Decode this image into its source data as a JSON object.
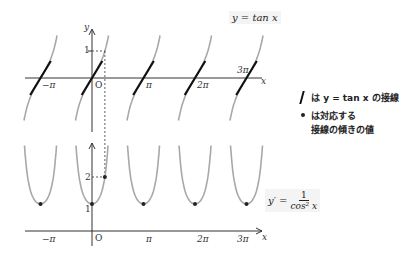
{
  "chart_data": [
    {
      "type": "line",
      "title": "y = tan x",
      "function": "tan x",
      "xlabel": "x",
      "ylabel": "y",
      "x_ticks": [
        "−π",
        "O",
        "π",
        "2π",
        "3π"
      ],
      "x_tick_values_over_pi": [
        -1,
        0,
        1,
        2,
        3
      ],
      "y_ticks": [
        "1"
      ],
      "y_tick_values": [
        1
      ],
      "branches_centered_at_over_pi": [
        -1,
        0,
        1,
        2,
        3
      ],
      "tangent_points_over_pi": [
        -1,
        0,
        1,
        2,
        3
      ],
      "tangent_slope": 1,
      "dashed_guide": {
        "x_over_pi": 0.25,
        "y": 1
      },
      "ylim": [
        -1.6,
        1.6
      ],
      "xlim_over_pi": [
        -1.5,
        3.3
      ]
    },
    {
      "type": "line",
      "title": "y' = 1 / cos² x",
      "function": "1/cos^2 x",
      "xlabel": "x",
      "ylabel": "",
      "x_ticks": [
        "−π",
        "O",
        "π",
        "2π",
        "3π"
      ],
      "x_tick_values_over_pi": [
        -1,
        0,
        1,
        2,
        3
      ],
      "y_ticks": [
        "1",
        "2"
      ],
      "y_tick_values": [
        1,
        2
      ],
      "minimum_points": [
        {
          "x_over_pi": -1,
          "y": 1
        },
        {
          "x_over_pi": 0,
          "y": 1
        },
        {
          "x_over_pi": 1,
          "y": 1
        },
        {
          "x_over_pi": 2,
          "y": 1
        },
        {
          "x_over_pi": 3,
          "y": 1
        }
      ],
      "highlight_point": {
        "x_over_pi": 0.25,
        "y": 2
      },
      "ylim": [
        0,
        3.5
      ],
      "xlim_over_pi": [
        -1.5,
        3.3
      ]
    }
  ],
  "labels": {
    "top_formula": "y = tan x",
    "top_y_axis": "y",
    "top_x_axis": "x",
    "top_y_one": "1",
    "origin": "O",
    "neg_pi": "−π",
    "pi": "π",
    "two_pi": "2π",
    "three_pi": "3π",
    "bottom_x_axis": "x",
    "bottom_y_one": "1",
    "bottom_y_two": "2",
    "bottom_formula_lhs": "y′ =",
    "bottom_formula_num": "1",
    "bottom_formula_den": "cos² x"
  },
  "legend": {
    "line_text": "は y = tan x の接線",
    "dot_text_1": "は対応する",
    "dot_text_2": "接線の傾きの値"
  },
  "colors": {
    "curve": "#a8a8a8",
    "tangent": "#111111",
    "axis": "#333333",
    "dot": "#222222"
  }
}
